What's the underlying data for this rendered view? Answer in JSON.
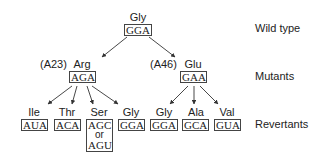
{
  "row_labels": {
    "wild_type": "Wild type",
    "mutants": "Mutants",
    "revertants": "Revertants"
  },
  "wild_type": {
    "amino_acid": "Gly",
    "codon": "GGA"
  },
  "mutants": [
    {
      "position": "(A23)",
      "amino_acid": "Arg",
      "codon": "AGA"
    },
    {
      "position": "(A46)",
      "amino_acid": "Glu",
      "codon": "GAA"
    }
  ],
  "revertants": [
    {
      "parent": "Arg",
      "amino_acid": "Ile",
      "codon": "AUA"
    },
    {
      "parent": "Arg",
      "amino_acid": "Thr",
      "codon": "ACA"
    },
    {
      "parent": "Arg",
      "amino_acid": "Ser",
      "codon": "AGC",
      "alt_connector": "or",
      "alt_codon": "AGU"
    },
    {
      "parent": "Arg",
      "amino_acid": "Gly",
      "codon": "GGA"
    },
    {
      "parent": "Glu",
      "amino_acid": "Gly",
      "codon": "GGA"
    },
    {
      "parent": "Glu",
      "amino_acid": "Ala",
      "codon": "GCA"
    },
    {
      "parent": "Glu",
      "amino_acid": "Val",
      "codon": "GUA"
    }
  ],
  "colors": {
    "text": "#222222",
    "box_border": "#444444",
    "arrow": "#333333",
    "background": "#ffffff"
  }
}
